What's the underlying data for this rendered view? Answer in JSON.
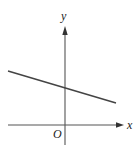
{
  "diagram": {
    "type": "coordinate-plane",
    "labels": {
      "y_axis": "y",
      "x_axis": "x",
      "origin": "O"
    },
    "line": {
      "description": "straight line with negative slope and positive y-intercept",
      "slope_sign": "negative",
      "y_intercept_sign": "positive"
    },
    "colors": {
      "axis": "#444444",
      "line": "#444444",
      "background": "#ffffff"
    }
  }
}
